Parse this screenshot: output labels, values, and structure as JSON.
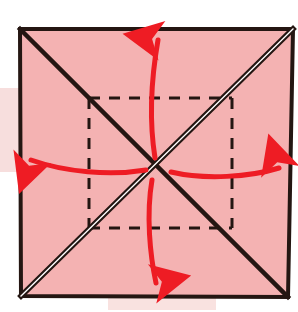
{
  "figure": {
    "canvas": {
      "width": 298,
      "height": 312,
      "background": "#ffffff"
    },
    "paper": {
      "name": "paper-square",
      "fill": "#f4b2b2",
      "stroke": "#241612",
      "stroke_width": 4,
      "corners": {
        "top_left": [
          20,
          29
        ],
        "top_right": [
          293,
          29
        ],
        "bottom_right": [
          288,
          297
        ],
        "bottom_left": [
          21,
          296
        ]
      }
    },
    "creases": {
      "diagonal_main": {
        "label": "valley crease top-left to bottom-right",
        "from": [
          20,
          29
        ],
        "to": [
          288,
          297
        ],
        "style": "solid",
        "color": "#241612",
        "width": 4
      },
      "diagonal_anti": {
        "label": "mountain crease bottom-left to top-right",
        "from": [
          21,
          296
        ],
        "to": [
          293,
          29
        ],
        "style": "double",
        "color": "#241612",
        "inner_color": "#ffffff",
        "width": 5
      },
      "inner_square": {
        "label": "dashed inner square fold lines",
        "left": 89,
        "top": 98,
        "right": 232,
        "bottom": 228,
        "style": "dashed",
        "color": "#241612",
        "width": 3,
        "dash": "11 9"
      }
    },
    "center_point": [
      157,
      167
    ],
    "arrows": [
      {
        "name": "arrow-up",
        "direction": "up",
        "color": "#ee1c24",
        "width": 5,
        "path": "M 155 158 C 149 120, 151 80, 158 40",
        "head": [
          158,
          33
        ]
      },
      {
        "name": "arrow-down",
        "direction": "down",
        "color": "#ee1c24",
        "width": 5,
        "path": "M 152 180 C 146 215, 150 255, 156 283",
        "head": [
          158,
          291
        ]
      },
      {
        "name": "arrow-left",
        "direction": "left",
        "color": "#ee1c24",
        "width": 5,
        "path": "M 146 170 C 110 176, 65 172, 31 160",
        "head": [
          22,
          157
        ]
      },
      {
        "name": "arrow-right",
        "direction": "right",
        "color": "#ee1c24",
        "width": 5,
        "path": "M 171 172 C 205 180, 250 177, 279 168",
        "head": [
          288,
          165
        ]
      }
    ],
    "smudges": [
      {
        "name": "smudge-left",
        "x": 0,
        "y": 88,
        "width": 24,
        "height": 84,
        "color": "#f7dedd"
      },
      {
        "name": "smudge-bottom",
        "x": 108,
        "y": 297,
        "width": 108,
        "height": 13,
        "color": "#f9e2e0"
      }
    ]
  }
}
